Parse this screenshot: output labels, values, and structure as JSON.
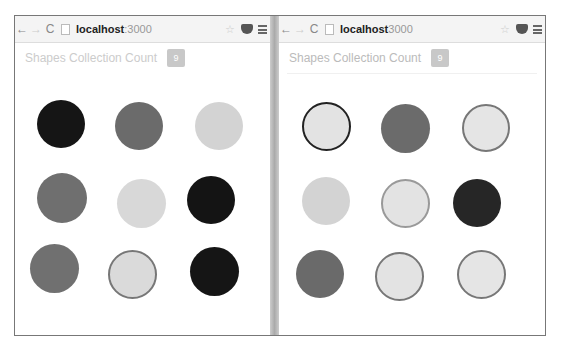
{
  "windows": [
    {
      "url_host": "localhost",
      "url_port": ":3000",
      "title": "Shapes Collection Count",
      "count": "9",
      "shapes": [
        {
          "x": 22,
          "y": 84,
          "d": 48,
          "fill": "#151515",
          "stroke": "none"
        },
        {
          "x": 100,
          "y": 86,
          "d": 48,
          "fill": "#6b6b6b",
          "stroke": "none"
        },
        {
          "x": 180,
          "y": 86,
          "d": 48,
          "fill": "#d3d3d3",
          "stroke": "none"
        },
        {
          "x": 22,
          "y": 157,
          "d": 50,
          "fill": "#6f6f6f",
          "stroke": "none"
        },
        {
          "x": 102,
          "y": 163,
          "d": 49,
          "fill": "#d8d8d8",
          "stroke": "none"
        },
        {
          "x": 172,
          "y": 160,
          "d": 48,
          "fill": "#141414",
          "stroke": "none"
        },
        {
          "x": 15,
          "y": 228,
          "d": 49,
          "fill": "#707070",
          "stroke": "none"
        },
        {
          "x": 93,
          "y": 234,
          "d": 49,
          "fill": "#dadada",
          "stroke": "#777"
        },
        {
          "x": 175,
          "y": 231,
          "d": 49,
          "fill": "#151515",
          "stroke": "none"
        }
      ]
    },
    {
      "url_host": "localhost",
      "url_port": " 3000",
      "title": "Shapes Collection Count",
      "count": "9",
      "shapes": [
        {
          "x": 23,
          "y": 86,
          "d": 49,
          "fill": "#e3e3e3",
          "stroke": "#222"
        },
        {
          "x": 102,
          "y": 88,
          "d": 49,
          "fill": "#6b6b6b",
          "stroke": "none"
        },
        {
          "x": 183,
          "y": 88,
          "d": 48,
          "fill": "#e5e5e5",
          "stroke": "#777"
        },
        {
          "x": 23,
          "y": 161,
          "d": 48,
          "fill": "#d3d3d3",
          "stroke": "none"
        },
        {
          "x": 102,
          "y": 163,
          "d": 49,
          "fill": "#e3e3e3",
          "stroke": "#999"
        },
        {
          "x": 174,
          "y": 163,
          "d": 48,
          "fill": "#262626",
          "stroke": "none"
        },
        {
          "x": 17,
          "y": 234,
          "d": 48,
          "fill": "#6a6a6a",
          "stroke": "none"
        },
        {
          "x": 96,
          "y": 236,
          "d": 49,
          "fill": "#e3e3e3",
          "stroke": "#777"
        },
        {
          "x": 178,
          "y": 234,
          "d": 49,
          "fill": "#e5e5e5",
          "stroke": "#777"
        }
      ]
    }
  ],
  "toolbar": {
    "back": "←",
    "forward": "→",
    "reload": "C",
    "star": "☆"
  }
}
